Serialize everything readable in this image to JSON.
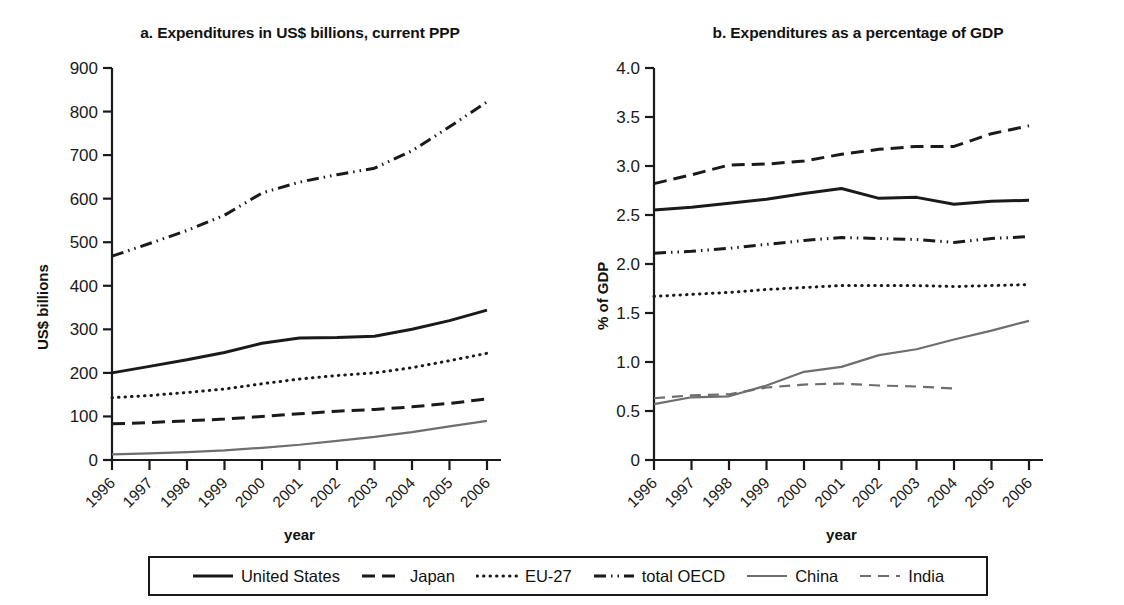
{
  "figure": {
    "panel_a_title": "a. Expenditures in US$ billions, current PPP",
    "panel_b_title": "b. Expenditures as a percentage of GDP",
    "xlabel": "year",
    "ylabel_a": "US$ billions",
    "ylabel_b": "% of GDP"
  },
  "legend": {
    "items": [
      {
        "label": "United States",
        "style": "solid-thick",
        "color": "#1a1a1a"
      },
      {
        "label": "Japan",
        "style": "dashed",
        "color": "#1a1a1a"
      },
      {
        "label": "EU-27",
        "style": "dotted",
        "color": "#1a1a1a"
      },
      {
        "label": "total OECD",
        "style": "dash-dot",
        "color": "#1a1a1a"
      },
      {
        "label": "China",
        "style": "solid-thin",
        "color": "#6e6e6e"
      },
      {
        "label": "India",
        "style": "dashed-thin",
        "color": "#6e6e6e"
      }
    ]
  },
  "chart_data": [
    {
      "type": "line",
      "panel": "a",
      "title": "a. Expenditures in US$ billions, current PPP",
      "xlabel": "year",
      "ylabel": "US$ billions",
      "x": [
        1996,
        1997,
        1998,
        1999,
        2000,
        2001,
        2002,
        2003,
        2004,
        2005,
        2006
      ],
      "xlim": [
        1996,
        2006
      ],
      "ylim": [
        0,
        900
      ],
      "yticks": [
        0,
        100,
        200,
        300,
        400,
        500,
        600,
        700,
        800,
        900
      ],
      "grid": false,
      "legend_position": "bottom",
      "series": [
        {
          "name": "United States",
          "values": [
            200,
            215,
            230,
            247,
            268,
            280,
            281,
            284,
            300,
            320,
            344
          ]
        },
        {
          "name": "Japan",
          "values": [
            83,
            86,
            90,
            94,
            100,
            106,
            112,
            116,
            122,
            130,
            140
          ]
        },
        {
          "name": "EU-27",
          "values": [
            143,
            148,
            155,
            163,
            175,
            186,
            194,
            200,
            212,
            228,
            245
          ]
        },
        {
          "name": "total OECD",
          "values": [
            468,
            497,
            527,
            562,
            613,
            638,
            655,
            670,
            710,
            765,
            822
          ]
        },
        {
          "name": "China",
          "values": [
            13,
            15,
            18,
            22,
            28,
            35,
            44,
            53,
            64,
            77,
            90
          ]
        }
      ]
    },
    {
      "type": "line",
      "panel": "b",
      "title": "b. Expenditures as a percentage of GDP",
      "xlabel": "year",
      "ylabel": "% of GDP",
      "x": [
        1996,
        1997,
        1998,
        1999,
        2000,
        2001,
        2002,
        2003,
        2004,
        2005,
        2006
      ],
      "xlim": [
        1996,
        2006
      ],
      "ylim": [
        0,
        4.0
      ],
      "yticks": [
        0,
        0.5,
        1.0,
        1.5,
        2.0,
        2.5,
        3.0,
        3.5,
        4.0
      ],
      "grid": false,
      "legend_position": "bottom",
      "series": [
        {
          "name": "United States",
          "values": [
            2.55,
            2.58,
            2.62,
            2.66,
            2.72,
            2.77,
            2.67,
            2.68,
            2.61,
            2.64,
            2.65
          ]
        },
        {
          "name": "Japan",
          "values": [
            2.82,
            2.91,
            3.01,
            3.02,
            3.05,
            3.12,
            3.17,
            3.2,
            3.2,
            3.33,
            3.41
          ]
        },
        {
          "name": "EU-27",
          "values": [
            1.67,
            1.69,
            1.71,
            1.74,
            1.76,
            1.78,
            1.78,
            1.78,
            1.77,
            1.78,
            1.79
          ]
        },
        {
          "name": "total OECD",
          "values": [
            2.11,
            2.13,
            2.16,
            2.2,
            2.24,
            2.27,
            2.26,
            2.25,
            2.22,
            2.26,
            2.28
          ]
        },
        {
          "name": "China",
          "values": [
            0.57,
            0.64,
            0.65,
            0.76,
            0.9,
            0.95,
            1.07,
            1.13,
            1.23,
            1.32,
            1.42
          ]
        },
        {
          "name": "India",
          "values": [
            0.63,
            0.66,
            0.67,
            0.74,
            0.77,
            0.78,
            0.76,
            0.75,
            0.73,
            null,
            null
          ]
        }
      ]
    }
  ]
}
